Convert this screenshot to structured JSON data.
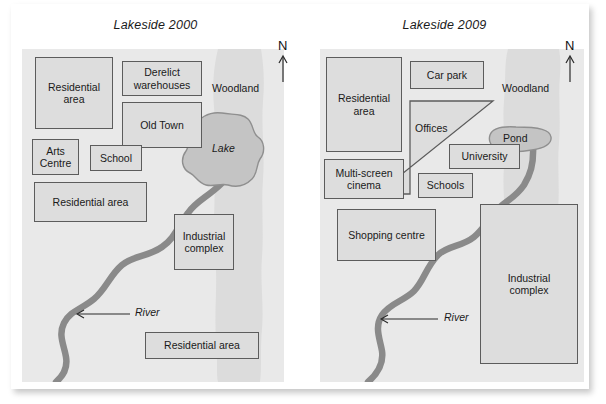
{
  "figure": {
    "kind": "two-panel comparison map",
    "background_color": "#ffffff",
    "map_background_color": "#e9e9e9",
    "woodland_color": "#dcdcdc",
    "zone_fill_color": "#dddddd",
    "zone_border_color": "#5c5c5c",
    "water_color": "#c4c4c4",
    "river_color": "#8a8a8a"
  },
  "panels": [
    {
      "id": "lakeside-2000",
      "title": "Lakeside 2000",
      "compass": {
        "label": "N",
        "icon": "north-arrow-icon"
      },
      "water": {
        "label": "Lake",
        "shape": "lake-blob"
      },
      "woodland_label": "Woodland",
      "river_label": "River",
      "river_arrow": "left-arrow-icon",
      "zones": [
        {
          "id": "residential-area-nw",
          "label": "Residential\narea",
          "line1": "Residential",
          "line2": "area"
        },
        {
          "id": "derelict-warehouses",
          "label": "Derelict\nwarehouses",
          "line1": "Derelict",
          "line2": "warehouses"
        },
        {
          "id": "old-town",
          "label": "Old Town",
          "line1": "Old Town",
          "line2": ""
        },
        {
          "id": "arts-centre",
          "label": "Arts\nCentre",
          "line1": "Arts",
          "line2": "Centre"
        },
        {
          "id": "school",
          "label": "School",
          "line1": "School",
          "line2": ""
        },
        {
          "id": "residential-area-w",
          "label": "Residential area",
          "line1": "Residential area",
          "line2": ""
        },
        {
          "id": "industrial-complex",
          "label": "Industrial\ncomplex",
          "line1": "Industrial",
          "line2": "complex"
        },
        {
          "id": "residential-area-s",
          "label": "Residential area",
          "line1": "Residential area",
          "line2": ""
        }
      ]
    },
    {
      "id": "lakeside-2009",
      "title": "Lakeside 2009",
      "compass": {
        "label": "N",
        "icon": "north-arrow-icon"
      },
      "water": {
        "label": "Pond",
        "shape": "pond-blob"
      },
      "woodland_label": "Woodland",
      "river_label": "River",
      "river_arrow": "left-arrow-icon",
      "zones": [
        {
          "id": "residential-area-nw",
          "label": "Residential\narea",
          "line1": "Residential",
          "line2": "area"
        },
        {
          "id": "car-park",
          "label": "Car park",
          "line1": "Car park",
          "line2": ""
        },
        {
          "id": "offices",
          "label": "Offices",
          "line1": "Offices",
          "line2": ""
        },
        {
          "id": "university",
          "label": "University",
          "line1": "University",
          "line2": ""
        },
        {
          "id": "multi-screen-cinema",
          "label": "Multi-screen\ncinema",
          "line1": "Multi-screen",
          "line2": "cinema"
        },
        {
          "id": "schools",
          "label": "Schools",
          "line1": "Schools",
          "line2": ""
        },
        {
          "id": "shopping-centre",
          "label": "Shopping centre",
          "line1": "Shopping centre",
          "line2": ""
        },
        {
          "id": "industrial-complex",
          "label": "Industrial\ncomplex",
          "line1": "Industrial",
          "line2": "complex"
        }
      ]
    }
  ]
}
